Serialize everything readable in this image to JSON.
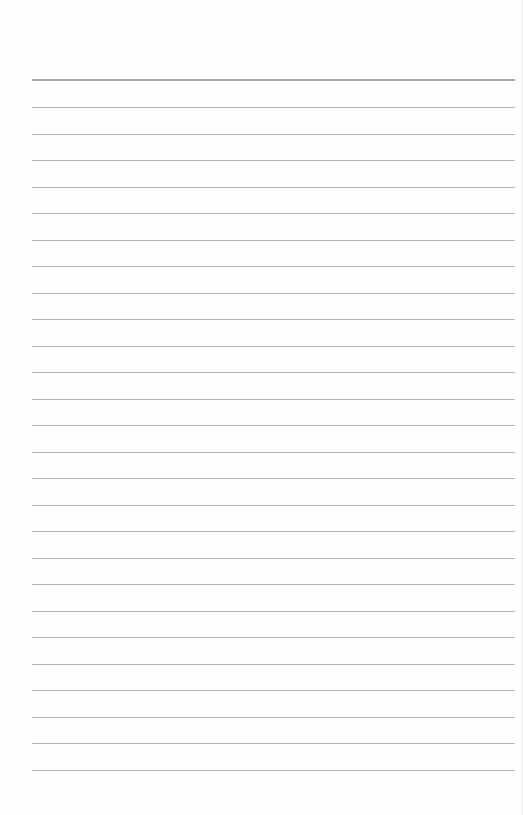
{
  "page": {
    "type": "lined-paper",
    "background": "#fefefe",
    "rule_color": "#b4b4b4",
    "header_rule_color": "#a8a8a8",
    "header_rule_top": 79,
    "first_rule_top": 107,
    "rule_spacing": 26.5,
    "rule_count": 26,
    "rule_left": 32,
    "rule_width": 483
  }
}
